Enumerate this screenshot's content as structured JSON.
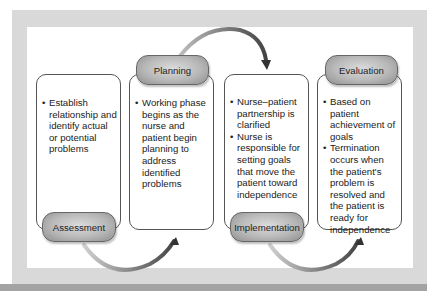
{
  "diagram": {
    "phases": [
      {
        "label": "Assessment",
        "bullets": [
          "Establish relationship and identify actual or potential problems"
        ]
      },
      {
        "label": "Planning",
        "bullets": [
          "Working phase begins as the nurse and patient begin planning to address identified problems"
        ]
      },
      {
        "label": "Implementation",
        "bullets": [
          "Nurse–patient partnership is clarified",
          "Nurse is responsible for setting goals that move the patient toward independence"
        ]
      },
      {
        "label": "Evaluation",
        "bullets": [
          "Based on patient achievement of goals",
          "Termination occurs when the patient's problem is resolved and the patient is ready for independence"
        ]
      }
    ],
    "colors": {
      "frame": "#d9d9d9",
      "pill": "#b8b8b8",
      "arrow": "#777777",
      "box_border": "#555555"
    }
  }
}
